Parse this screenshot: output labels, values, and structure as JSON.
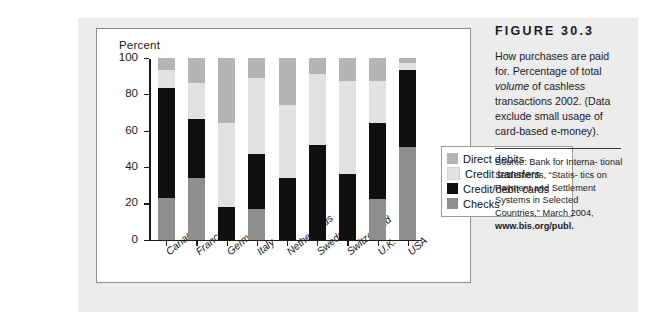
{
  "figure": {
    "number": "FIGURE 30.3",
    "caption_line1": "How purchases are paid",
    "caption_line2": "for. Percentage of total",
    "caption_em": "volume",
    "caption_line3_rest": " of cashless",
    "caption_line4": "transactions 2002. (Data",
    "caption_line5": "exclude small usage of",
    "caption_line6": "card-based e-money).",
    "source_line1": "Source: Bank for Interna-",
    "source_line2": "tional Settlements, “Statis-",
    "source_line3": "tics on Payment and",
    "source_line4": "Settlement Systems in",
    "source_line5": "Selected Countries,” March",
    "source_line6_prefix": "2004, ",
    "source_url": "www.bis.org/publ."
  },
  "chart_data": {
    "type": "bar",
    "subtype": "stacked-vertical-100-percent",
    "title": "",
    "axis_title": "Percent",
    "xlabel": "",
    "ylabel": "Percent",
    "ylim": [
      0,
      100
    ],
    "yticks": [
      0,
      20,
      40,
      60,
      80,
      100
    ],
    "ytick_labels": [
      "0",
      "20",
      "40",
      "60",
      "80",
      "100"
    ],
    "grid": false,
    "legend_position": "right-inside",
    "categories": [
      "Canada",
      "France",
      "Germany",
      "Italy",
      "Netherlands",
      "Sweden",
      "Switzerland",
      "U.K.",
      "USA"
    ],
    "series": [
      {
        "name": "Checks",
        "color": "#8e8e8e",
        "values": [
          23,
          34,
          0,
          17,
          0,
          0,
          0,
          22,
          51
        ]
      },
      {
        "name": "Credit/debit cards",
        "color": "#101010",
        "values": [
          60,
          32,
          18,
          30,
          34,
          52,
          36,
          42,
          42
        ]
      },
      {
        "name": "Credit transfers",
        "color": "#e2e2e2",
        "values": [
          10,
          20,
          46,
          42,
          40,
          39,
          51,
          23,
          4
        ]
      },
      {
        "name": "Direct debits",
        "color": "#b4b4b4",
        "values": [
          7,
          14,
          36,
          11,
          26,
          9,
          13,
          13,
          3
        ]
      }
    ],
    "cumulative_tops": {
      "Canada": {
        "checks": 23,
        "cards": 83,
        "transfers": 93,
        "debits": 100
      },
      "France": {
        "checks": 34,
        "cards": 66,
        "transfers": 86,
        "debits": 100
      },
      "Germany": {
        "checks": 0,
        "cards": 18,
        "transfers": 64,
        "debits": 100
      },
      "Italy": {
        "checks": 17,
        "cards": 47,
        "transfers": 89,
        "debits": 100
      },
      "Netherlands": {
        "checks": 0,
        "cards": 34,
        "transfers": 74,
        "debits": 100
      },
      "Sweden": {
        "checks": 0,
        "cards": 52,
        "transfers": 91,
        "debits": 100
      },
      "Switzerland": {
        "checks": 0,
        "cards": 36,
        "transfers": 87,
        "debits": 100
      },
      "U.K.": {
        "checks": 22,
        "cards": 64,
        "transfers": 87,
        "debits": 100
      },
      "USA": {
        "checks": 51,
        "cards": 93,
        "transfers": 97,
        "debits": 100
      }
    },
    "legend": [
      {
        "label": "Direct debits",
        "color": "#b4b4b4"
      },
      {
        "label": "Credit transfers",
        "color": "#e2e2e2"
      },
      {
        "label": "Credit/debit cards",
        "color": "#101010"
      },
      {
        "label": "Checks",
        "color": "#8e8e8e"
      }
    ]
  }
}
